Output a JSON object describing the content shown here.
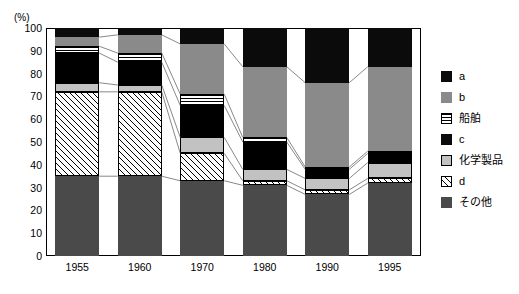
{
  "chart_data": {
    "type": "bar",
    "stacked": true,
    "title": "",
    "subtitle": "",
    "xlabel": "",
    "ylabel": "(%)",
    "yunit": "(%)",
    "ylim": [
      0,
      100
    ],
    "ytick_step": 10,
    "yticks": [
      100,
      90,
      80,
      70,
      60,
      50,
      40,
      30,
      20,
      10,
      0
    ],
    "ytick_labels": [
      "100",
      "90",
      "80",
      "70",
      "60",
      "50",
      "40",
      "30",
      "20",
      "10",
      "0"
    ],
    "grid": false,
    "legend_position": "right",
    "categories": [
      "1955",
      "1960",
      "1970",
      "1980",
      "1990",
      "1995"
    ],
    "stack_order_top_to_bottom": [
      "a",
      "b",
      "船舶",
      "c",
      "化学製品",
      "d",
      "その他"
    ],
    "series": [
      {
        "name": "a",
        "fill": "solid-black",
        "color": "#0b0b0b",
        "values": [
          4,
          3,
          7,
          17,
          24,
          17
        ]
      },
      {
        "name": "b",
        "fill": "solid-gray",
        "color": "#8a8a8a",
        "values": [
          4,
          8,
          22,
          31,
          37,
          37
        ]
      },
      {
        "name": "船舶",
        "fill": "horizontal-stripes",
        "color": "#ffffff",
        "values": [
          3,
          4,
          5,
          2,
          1,
          1
        ]
      },
      {
        "name": "c",
        "fill": "solid-black",
        "color": "#000000",
        "values": [
          13,
          10,
          14,
          12,
          4,
          4
        ]
      },
      {
        "name": "化学製品",
        "fill": "light-gray",
        "color": "#c2c2c2",
        "values": [
          4,
          3,
          7,
          5,
          5,
          7
        ]
      },
      {
        "name": "d",
        "fill": "diagonal-hatch",
        "color": "#ffffff",
        "values": [
          37,
          37,
          12,
          2,
          2,
          2
        ]
      },
      {
        "name": "その他",
        "fill": "solid-darkgray",
        "color": "#4a4a4a",
        "values": [
          35,
          35,
          33,
          31,
          27,
          32
        ]
      }
    ],
    "cumulative_tops": {
      "1955": {
        "a": 100,
        "b": 96,
        "船舶": 92,
        "c": 89,
        "化学製品": 76,
        "d": 72,
        "その他": 35
      },
      "1960": {
        "a": 100,
        "b": 97,
        "船舶": 89,
        "c": 85,
        "化学製品": 75,
        "d": 72,
        "その他": 35
      },
      "1970": {
        "a": 100,
        "b": 93,
        "船舶": 71,
        "c": 66,
        "化学製品": 52,
        "d": 45,
        "その他": 33
      },
      "1980": {
        "a": 100,
        "b": 83,
        "船舶": 52,
        "c": 50,
        "化学製品": 38,
        "d": 33,
        "その他": 31
      },
      "1990": {
        "a": 100,
        "b": 76,
        "船舶": 39,
        "c": 38,
        "化学製品": 34,
        "d": 29,
        "その他": 27
      },
      "1995": {
        "a": 100,
        "b": 83,
        "船舶": 46,
        "c": 45,
        "化学製品": 41,
        "d": 34,
        "その他": 32
      }
    }
  },
  "legend": {
    "items": [
      {
        "label": "a",
        "swatch": "solid-black"
      },
      {
        "label": "b",
        "swatch": "solid-gray"
      },
      {
        "label": "船舶",
        "swatch": "horizontal-stripes"
      },
      {
        "label": "c",
        "swatch": "solid-black"
      },
      {
        "label": "化学製品",
        "swatch": "light-gray"
      },
      {
        "label": "d",
        "swatch": "diagonal-hatch"
      },
      {
        "label": "その他",
        "swatch": "solid-darkgray"
      }
    ]
  }
}
